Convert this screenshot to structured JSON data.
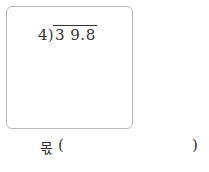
{
  "problem": {
    "divisor": "4",
    "bracket": ")",
    "dividend": "3 9.8"
  },
  "answer": {
    "label": "몫",
    "open_paren": "(",
    "close_paren": ")",
    "value": ""
  }
}
